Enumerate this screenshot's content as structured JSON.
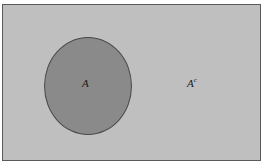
{
  "figure": {
    "kind": "venn-diagram",
    "background_color": "#ffffff"
  },
  "universe": {
    "name": "universal-set-rectangle",
    "fill_color": "#bfbfbf",
    "border_color": "#5a5a5a",
    "x": 2,
    "y": 4,
    "width": 259,
    "height": 157
  },
  "set_a": {
    "label": "A",
    "fill_color": "#8a8a8a",
    "border_color": "#4a4a4a",
    "center_x": 85,
    "center_y": 81,
    "radius_x": 44,
    "radius_y": 49
  },
  "complement": {
    "label_base": "A",
    "label_superscript": "c",
    "label_full": "Ac",
    "x": 184,
    "y": 73
  },
  "chart_data": {
    "type": "venn",
    "title": "",
    "regions": [
      {
        "name": "A",
        "label": "A",
        "shape": "circle",
        "fill": "#8a8a8a",
        "shaded": true
      },
      {
        "name": "A-complement",
        "label": "Ac",
        "shape": "rectangle-minus-circle",
        "fill": "#bfbfbf",
        "shaded": false
      }
    ],
    "legend": [],
    "annotations": [
      "A",
      "Ac"
    ]
  }
}
